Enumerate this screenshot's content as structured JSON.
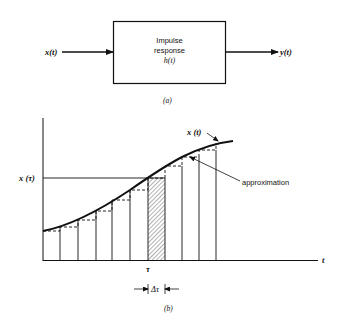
{
  "figure_a": {
    "input_label": "x(t)",
    "block_lines": [
      "Impulse",
      "response",
      "h(t)"
    ],
    "output_label": "y(t)",
    "caption": "(a)"
  },
  "figure_b": {
    "curve_label": "x (t)",
    "level_label": "x (τ)",
    "approx_label": "approximation",
    "tau_label": "τ",
    "delta_tau_label": "Δτ",
    "time_axis_label": "t",
    "caption": "(b)",
    "bar_edges_x": [
      43,
      60,
      78,
      96,
      112,
      130,
      148,
      165,
      182,
      199,
      216
    ],
    "hatched_bar_index": 6
  }
}
